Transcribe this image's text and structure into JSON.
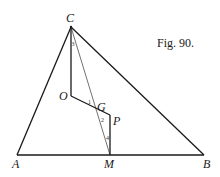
{
  "figure": {
    "caption": "Fig. 90.",
    "background": "#ffffff",
    "ink": "#1a1a1a"
  },
  "points": {
    "A": {
      "label": "A",
      "x": 17,
      "y": 155
    },
    "B": {
      "label": "B",
      "x": 204,
      "y": 155
    },
    "C": {
      "label": "C",
      "x": 71,
      "y": 27
    },
    "M": {
      "label": "M",
      "x": 110,
      "y": 155
    },
    "O": {
      "label": "O",
      "x": 71,
      "y": 96
    },
    "G": {
      "label": "G",
      "x": 98,
      "y": 109
    },
    "P": {
      "label": "P",
      "x": 110,
      "y": 115
    }
  },
  "angles": [
    {
      "label": "3",
      "at": "C"
    },
    {
      "label": "1",
      "at": "G"
    },
    {
      "label": "2",
      "at": "G"
    },
    {
      "label": "4",
      "at": "M"
    }
  ],
  "segments": [
    {
      "from": "A",
      "to": "B",
      "weight": "thick"
    },
    {
      "from": "A",
      "to": "C",
      "weight": "thick"
    },
    {
      "from": "C",
      "to": "B",
      "weight": "thick"
    },
    {
      "from": "C",
      "to": "O",
      "weight": "thick"
    },
    {
      "from": "O",
      "to": "P",
      "weight": "thick"
    },
    {
      "from": "P",
      "to": "M",
      "weight": "thick"
    },
    {
      "from": "C",
      "to": "M",
      "weight": "thin"
    }
  ]
}
